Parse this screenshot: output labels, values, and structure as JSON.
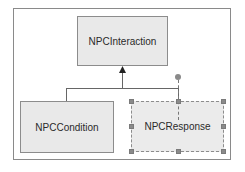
{
  "diagram": {
    "type": "class-inheritance",
    "parent": {
      "label": "NPCInteraction"
    },
    "children": [
      {
        "label": "NPCCondition",
        "selected": false
      },
      {
        "label": "NPCResponse",
        "selected": true
      }
    ],
    "relation": "generalization",
    "colors": {
      "box_fill": "#e9e9e9",
      "box_border": "#8c8c8c",
      "line": "#666666",
      "handle": "#8a8a8a",
      "background": "#ffffff"
    }
  }
}
